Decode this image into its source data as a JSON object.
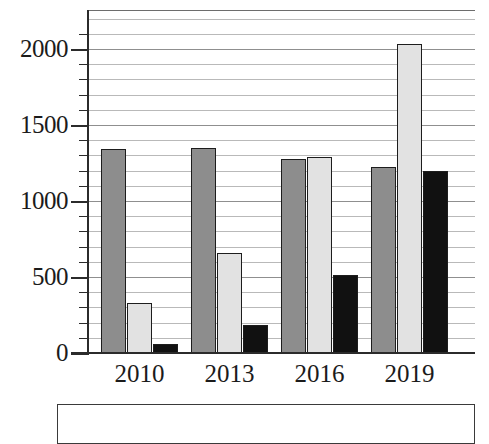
{
  "chart_data": {
    "type": "bar",
    "title": "",
    "subtitle": "",
    "xlabel": "",
    "ylabel": "",
    "categories": [
      "2010",
      "2013",
      "2016",
      "2019"
    ],
    "series": [
      {
        "name": "series-1",
        "color": "#8d8d8d",
        "values": [
          1340,
          1350,
          1275,
          1225
        ]
      },
      {
        "name": "series-2",
        "color": "#e2e2e2",
        "values": [
          330,
          660,
          1290,
          2035
        ]
      },
      {
        "name": "series-3",
        "color": "#111111",
        "values": [
          60,
          185,
          515,
          1200
        ]
      }
    ],
    "ylim": [
      0,
      2240
    ],
    "ytick_labels": [
      "0",
      "500",
      "1000",
      "1500",
      "2000"
    ],
    "ytick_values": [
      0,
      500,
      1000,
      1500,
      2000
    ],
    "minor_tick_interval": 100,
    "grid": true,
    "grid_axis": "y",
    "legend_position": "bottom",
    "legend_entries": []
  },
  "axes": {
    "y_ticks": [
      {
        "label": "2000",
        "value": 2000
      },
      {
        "label": "1500",
        "value": 1500
      },
      {
        "label": "1000",
        "value": 1000
      },
      {
        "label": "500",
        "value": 500
      },
      {
        "label": "0",
        "value": 0
      }
    ],
    "x_ticks": [
      {
        "label": "2010"
      },
      {
        "label": "2013"
      },
      {
        "label": "2016"
      },
      {
        "label": "2019"
      }
    ]
  },
  "colors": {
    "series_1": "#8d8d8d",
    "series_2": "#e2e2e2",
    "series_3": "#111111",
    "axis": "#2b2b2b",
    "gridline": "#b9b9b9",
    "background": "#ffffff"
  }
}
